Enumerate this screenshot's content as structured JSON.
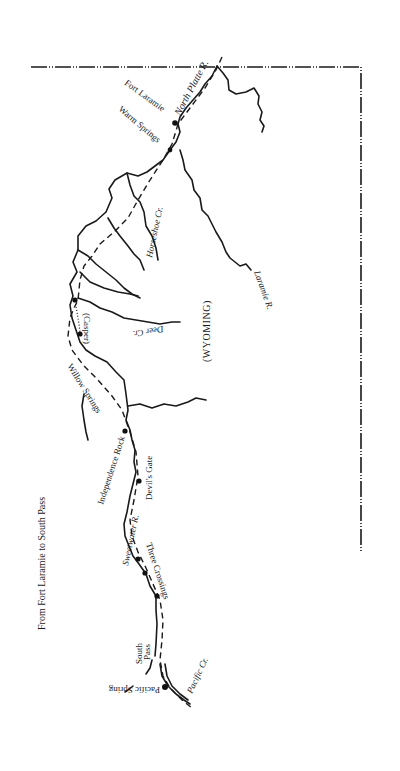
{
  "map": {
    "title": "From Fort Laramie to South Pass",
    "region_label": "(WYOMING)",
    "colors": {
      "ink": "#1a1a1a",
      "paper": "#ffffff"
    },
    "rivers": {
      "north_platte": "North Platte R.",
      "horseshoe": "Horseshoe Cr.",
      "laramie": "Laramie R.",
      "deer": "Deer Cr.",
      "sweetwater": "Sweetwater R.",
      "pacific": "Pacific Cr."
    },
    "places": {
      "fort_laramie": "Fort Laramie",
      "warm_springs": "Warm Springs",
      "casper": "(Casper)",
      "willow_springs": "Willow Springs",
      "independence_rock": "Independence Rock",
      "devils_gate": "Devil's Gate",
      "three_crossings": "Three Crossings",
      "south_pass_1": "South",
      "south_pass_2": "Pass",
      "pacific_spring": "Pacific Spring"
    }
  }
}
